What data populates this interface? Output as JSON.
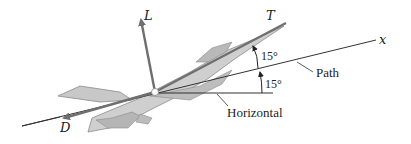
{
  "diagram": {
    "forces": {
      "lift": {
        "label": "L"
      },
      "thrust": {
        "label": "T"
      },
      "drag": {
        "label": "D"
      }
    },
    "axes": {
      "x": {
        "label": "x"
      }
    },
    "annotations": {
      "path": "Path",
      "horizontal": "Horizontal",
      "angle_thrust_to_path": "15°",
      "angle_path_to_horizontal": "15°"
    },
    "colors": {
      "force_arrow": "#6f6f6f",
      "line": "#333333",
      "aircraft_fill": "#c8c8c8",
      "aircraft_edge": "#8a8a8a"
    }
  }
}
